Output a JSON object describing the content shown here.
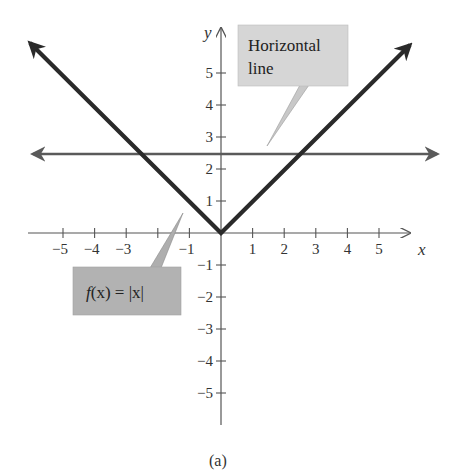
{
  "chart_data": {
    "type": "line",
    "title": "",
    "caption": "(a)",
    "xlabel": "x",
    "ylabel": "y",
    "xlim": [
      -6,
      6
    ],
    "ylim": [
      -6,
      6
    ],
    "grid": false,
    "x_ticks": [
      -5,
      -4,
      -3,
      -1,
      1,
      2,
      3,
      4,
      5
    ],
    "x_tick_labels": [
      "−5",
      "−4",
      "−3",
      "−1",
      "1",
      "2",
      "3",
      "4",
      "5"
    ],
    "y_ticks": [
      5,
      4,
      3,
      2,
      1,
      -1,
      -2,
      -3,
      -4,
      -5
    ],
    "y_tick_labels": [
      "5",
      "4",
      "3",
      "2",
      "1",
      "−1",
      "−2",
      "−3",
      "−4",
      "−5"
    ],
    "series": [
      {
        "name": "f(x) = |x|",
        "x": [
          -6,
          -5,
          -4,
          -3,
          -2,
          -1,
          0,
          1,
          2,
          3,
          4,
          5,
          6
        ],
        "y": [
          6,
          5,
          4,
          3,
          2,
          1,
          0,
          1,
          2,
          3,
          4,
          5,
          6
        ],
        "style": "thick dark line with arrowheads at both ends"
      },
      {
        "name": "Horizontal line",
        "x": [
          -6,
          6
        ],
        "y": [
          2.5,
          2.5
        ],
        "style": "medium gray line with arrowheads at both ends"
      }
    ],
    "annotations": [
      {
        "text": "Horizontal line",
        "box_color": "#d4d4d4",
        "points_to": [
          1.4,
          2.5
        ]
      },
      {
        "text": "f(x) = |x|",
        "box_color": "#b4b4b4",
        "points_to": [
          -1.2,
          1.2
        ]
      }
    ]
  },
  "labels": {
    "x_axis": "x",
    "y_axis": "y",
    "callout_horizontal_line1": "Horizontal",
    "callout_horizontal_line2": "line",
    "callout_f_part1": "f",
    "callout_f_part2": "(x) = |x|",
    "caption": "(a)"
  },
  "ticks": {
    "x": [
      {
        "v": -5,
        "label": "−5"
      },
      {
        "v": -4,
        "label": "−4"
      },
      {
        "v": -3,
        "label": "−3"
      },
      {
        "v": -2,
        "label": ""
      },
      {
        "v": -1,
        "label": "−1"
      },
      {
        "v": 1,
        "label": "1"
      },
      {
        "v": 2,
        "label": "2"
      },
      {
        "v": 3,
        "label": "3"
      },
      {
        "v": 4,
        "label": "4"
      },
      {
        "v": 5,
        "label": "5"
      }
    ],
    "y": [
      {
        "v": 5,
        "label": "5"
      },
      {
        "v": 4,
        "label": "4"
      },
      {
        "v": 3,
        "label": "3"
      },
      {
        "v": 2,
        "label": "2"
      },
      {
        "v": 1,
        "label": "1"
      },
      {
        "v": -1,
        "label": "−1"
      },
      {
        "v": -2,
        "label": "−2"
      },
      {
        "v": -3,
        "label": "−3"
      },
      {
        "v": -4,
        "label": "−4"
      },
      {
        "v": -5,
        "label": "−5"
      }
    ]
  },
  "colors": {
    "axis": "#555555",
    "abs_line": "#2a2a2a",
    "horizontal_line": "#5a5a5a",
    "callout_top": "#d6d6d6",
    "callout_bottom": "#b2b2b2"
  }
}
